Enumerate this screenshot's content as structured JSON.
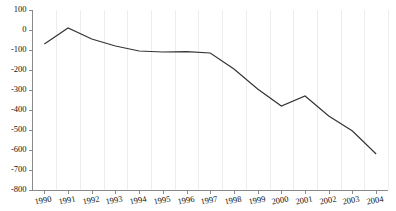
{
  "chart_data": {
    "type": "line",
    "title": "",
    "subtitle": "",
    "xlabel": "",
    "ylabel": "",
    "categories": [
      "1990",
      "1991",
      "1992",
      "1993",
      "1994",
      "1995",
      "1996",
      "1997",
      "1998",
      "1999",
      "2000",
      "2001",
      "2002",
      "2003",
      "2004"
    ],
    "x": [
      1990,
      1991,
      1992,
      1993,
      1994,
      1995,
      1996,
      1997,
      1998,
      1999,
      2000,
      2001,
      2002,
      2003,
      2004
    ],
    "values": [
      -70,
      10,
      -45,
      -80,
      -105,
      -110,
      -108,
      -115,
      -195,
      -295,
      -380,
      -330,
      -430,
      -505,
      -620
    ],
    "series": [
      {
        "name": "",
        "values": [
          -70,
          10,
          -45,
          -80,
          -105,
          -110,
          -108,
          -115,
          -195,
          -295,
          -380,
          -330,
          -430,
          -505,
          -620
        ]
      }
    ],
    "ylim": [
      -800,
      100
    ],
    "yticks": [
      100,
      0,
      -100,
      -200,
      -300,
      -400,
      -500,
      -600,
      -700,
      -800
    ],
    "ytick_labels": [
      "100",
      "0",
      "-100",
      "-200",
      "-300",
      "-400",
      "-500",
      "-600",
      "-700",
      "-800"
    ],
    "xtick_labels": [
      "1990",
      "1991",
      "1992",
      "1993",
      "1994",
      "1995",
      "1996",
      "1997",
      "1998",
      "1999",
      "2000",
      "2001",
      "2002",
      "2003",
      "2004"
    ],
    "grid": true,
    "grid_axis": "x",
    "legend": false,
    "legend_position": "none",
    "annotations": [],
    "colors": {
      "line": "#333333",
      "grid": "#ededed",
      "axis": "#8a8a8a",
      "text": "#111111",
      "background": "#ffffff"
    }
  }
}
